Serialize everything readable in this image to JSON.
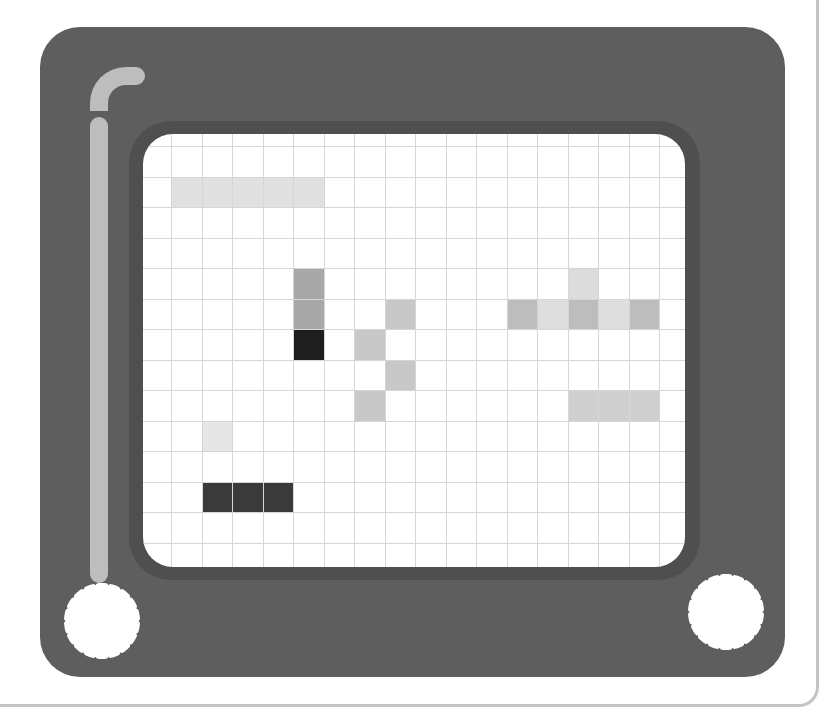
{
  "toy": {
    "name": "etch-a-sketch",
    "colors": {
      "frame": "#5e5e5e",
      "bezel": "#4f4f4f",
      "screen": "#ffffff",
      "grid_line": "#d6d6d6",
      "highlight": "#bdbdbd",
      "card_border": "#c4c4c4"
    },
    "knobs": [
      {
        "id": "left-knob",
        "cx": 102,
        "cy": 621
      },
      {
        "id": "right-knob",
        "cx": 726,
        "cy": 612
      }
    ]
  },
  "grid": {
    "origin_x": 28,
    "origin_y": 12,
    "cell_size": 30.5,
    "columns": 17,
    "rows": 14,
    "cells": [
      {
        "col": 0,
        "row": 1,
        "color": "#e0e0e0"
      },
      {
        "col": 1,
        "row": 1,
        "color": "#e0e0e0"
      },
      {
        "col": 2,
        "row": 1,
        "color": "#e0e0e0"
      },
      {
        "col": 3,
        "row": 1,
        "color": "#e0e0e0"
      },
      {
        "col": 4,
        "row": 1,
        "color": "#e0e0e0"
      },
      {
        "col": 4,
        "row": 4,
        "color": "#a8a8a8"
      },
      {
        "col": 4,
        "row": 5,
        "color": "#a8a8a8"
      },
      {
        "col": 4,
        "row": 6,
        "color": "#1e1e1e"
      },
      {
        "col": 7,
        "row": 5,
        "color": "#c8c8c8"
      },
      {
        "col": 6,
        "row": 6,
        "color": "#c8c8c8"
      },
      {
        "col": 7,
        "row": 7,
        "color": "#c8c8c8"
      },
      {
        "col": 6,
        "row": 8,
        "color": "#c8c8c8"
      },
      {
        "col": 13,
        "row": 4,
        "color": "#dcdcdc"
      },
      {
        "col": 11,
        "row": 5,
        "color": "#bdbdbd"
      },
      {
        "col": 12,
        "row": 5,
        "color": "#dedede"
      },
      {
        "col": 13,
        "row": 5,
        "color": "#bdbdbd"
      },
      {
        "col": 14,
        "row": 5,
        "color": "#dedede"
      },
      {
        "col": 15,
        "row": 5,
        "color": "#bdbdbd"
      },
      {
        "col": 13,
        "row": 8,
        "color": "#cfcfcf"
      },
      {
        "col": 14,
        "row": 8,
        "color": "#cfcfcf"
      },
      {
        "col": 15,
        "row": 8,
        "color": "#cfcfcf"
      },
      {
        "col": 1,
        "row": 9,
        "color": "#e6e6e6"
      },
      {
        "col": 1,
        "row": 11,
        "color": "#3a3a3a"
      },
      {
        "col": 2,
        "row": 11,
        "color": "#3a3a3a"
      },
      {
        "col": 3,
        "row": 11,
        "color": "#3a3a3a"
      }
    ]
  }
}
